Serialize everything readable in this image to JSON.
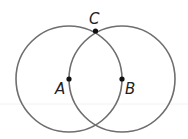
{
  "diagram": {
    "colors": {
      "circle_stroke": "#6e6e6e",
      "point_fill": "#111111",
      "label": "#222222",
      "guide_line": "#f0f0f0"
    },
    "circles": [
      {
        "name": "circle-centered-at-A",
        "cx": 69,
        "cy": 79,
        "r": 53
      },
      {
        "name": "circle-centered-at-B",
        "cx": 122,
        "cy": 79,
        "r": 53
      }
    ],
    "points": [
      {
        "label": "A",
        "x": 69,
        "y": 79,
        "label_x": 55,
        "label_y": 94
      },
      {
        "label": "B",
        "x": 122,
        "y": 79,
        "label_x": 125,
        "label_y": 94
      },
      {
        "label": "C",
        "x": 95.5,
        "y": 31,
        "label_x": 89,
        "label_y": 24
      }
    ]
  }
}
